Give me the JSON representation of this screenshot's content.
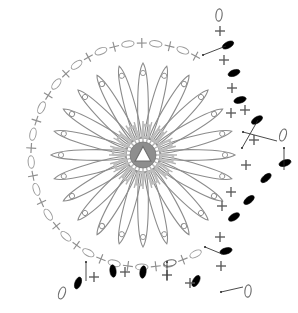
{
  "diagram": {
    "type": "crochet-pattern-chart",
    "background_color": "#ffffff",
    "legend_colors": {
      "petal_outline": "#8c8c8c",
      "center_ring": "#b0b0b0",
      "chain_open_outline": "#6b6b6b",
      "chain_solid_fill": "#000000",
      "single_crochet_cross": "#5a5a5a",
      "leader_line": "#2b2b2b"
    },
    "center": {
      "name": "magic-ring",
      "cx": 143,
      "cy": 155,
      "core_radius": 13,
      "triangle_size": 11,
      "spoke_count": 24,
      "ring_segment_count": 12
    },
    "petals": {
      "count": 24,
      "inner_radius": 17,
      "outer_radius": 92,
      "width": 13,
      "eye_radius": 2.6,
      "eye_offset_from_tip": 10,
      "start_angle_deg": -90
    },
    "border_round": {
      "name": "outer-chain-round",
      "radius": 112,
      "symbol_sequence": [
        "chain",
        "cross",
        "chain",
        "cross"
      ],
      "arc_start_deg": 62,
      "arc_end_deg": 298,
      "element_count": 34
    },
    "edging": {
      "name": "scalloped-edging",
      "solid_chain_count": 13,
      "open_chain_count": 5,
      "cross_count": 14,
      "leader_line_count": 7
    },
    "symbols": [
      {
        "name": "chain-stitch",
        "glyph": "oval-outline",
        "meaning": "chain"
      },
      {
        "name": "single-crochet",
        "glyph": "cross",
        "meaning": "sc"
      },
      {
        "name": "slip-stitch",
        "glyph": "oval-filled",
        "meaning": "sl st"
      },
      {
        "name": "magic-ring",
        "glyph": "triangle",
        "meaning": "ring"
      },
      {
        "name": "long-loop-petal",
        "glyph": "elongated-loop",
        "meaning": "petal"
      }
    ]
  }
}
